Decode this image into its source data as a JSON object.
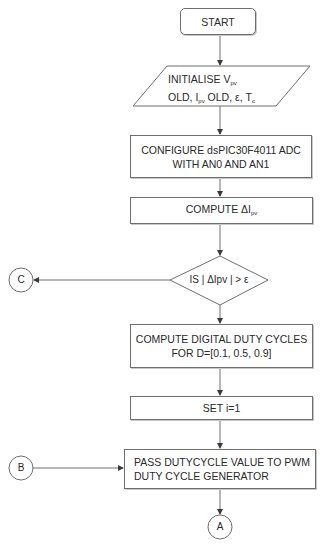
{
  "flowchart": {
    "start": {
      "label": "START"
    },
    "initialise": {
      "line1_prefix": "INITIALISE V",
      "line1_sub": "pv",
      "line2_a": "OLD, I",
      "line2_sub": "pv",
      "line2_b": " OLD, ε, T",
      "line2_sub2": "c"
    },
    "configure": {
      "line1": "CONFIGURE dsPIC30F4011 ADC",
      "line2": "WITH AN0 AND AN1"
    },
    "compute_delta": {
      "prefix": "COMPUTE ΔI",
      "sub": "pv"
    },
    "decision": {
      "label": "IS | ΔIpv | > ε"
    },
    "compute_duty": {
      "line1": "COMPUTE DIGITAL DUTY CYCLES",
      "line2": "FOR D=[0.1, 0.5, 0.9]"
    },
    "set_i": {
      "label": "SET i=1"
    },
    "pass_duty": {
      "line1": "PASS DUTYCYCLE VALUE TO PWM",
      "line2": "DUTY CYCLE GENERATOR"
    },
    "connectors": {
      "c": "C",
      "b": "B",
      "a": "A"
    }
  },
  "colors": {
    "stroke": "#6e6e6e",
    "text": "#2a2a2a",
    "background": "#ffffff"
  }
}
